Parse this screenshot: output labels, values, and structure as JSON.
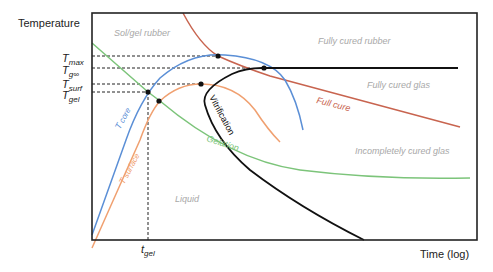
{
  "diagram": {
    "axes": {
      "y_label": "Temperature",
      "x_label": "Time (log)"
    },
    "y_ticks": [
      {
        "main": "T",
        "sub": "max"
      },
      {
        "main": "T",
        "sub": "g∞"
      },
      {
        "main": "T",
        "sub": "surf"
      },
      {
        "main": "T",
        "sub": "gel"
      }
    ],
    "x_ticks": [
      {
        "main": "t",
        "sub": "gel"
      }
    ],
    "regions": {
      "sol_gel_rubber": "Sol/gel rubber",
      "fully_cured_rubber": "Fully cured rubber",
      "fully_cured_glas": "Fully cured glas",
      "incompletely_cured_glas": "Incompletely cured glas",
      "liquid": "Liquid"
    },
    "curves": {
      "full_cure": {
        "label": "Full cure",
        "color": "#c8644f"
      },
      "vitrification": {
        "label": "Vitrification",
        "color": "#111111"
      },
      "gelation": {
        "label": "Gelation",
        "color": "#7cc47a"
      },
      "t_core": {
        "label_main": "T",
        "label_sub": "core",
        "color": "#5b8fd6"
      },
      "t_surface": {
        "label_main": "T",
        "label_sub": "surface",
        "color": "#f0a070"
      },
      "tg_inf_line": {
        "color": "#111111"
      }
    },
    "colors": {
      "frame": "#222222",
      "dashed_guides": "#222222",
      "region_text": "#a8a8a8"
    }
  }
}
